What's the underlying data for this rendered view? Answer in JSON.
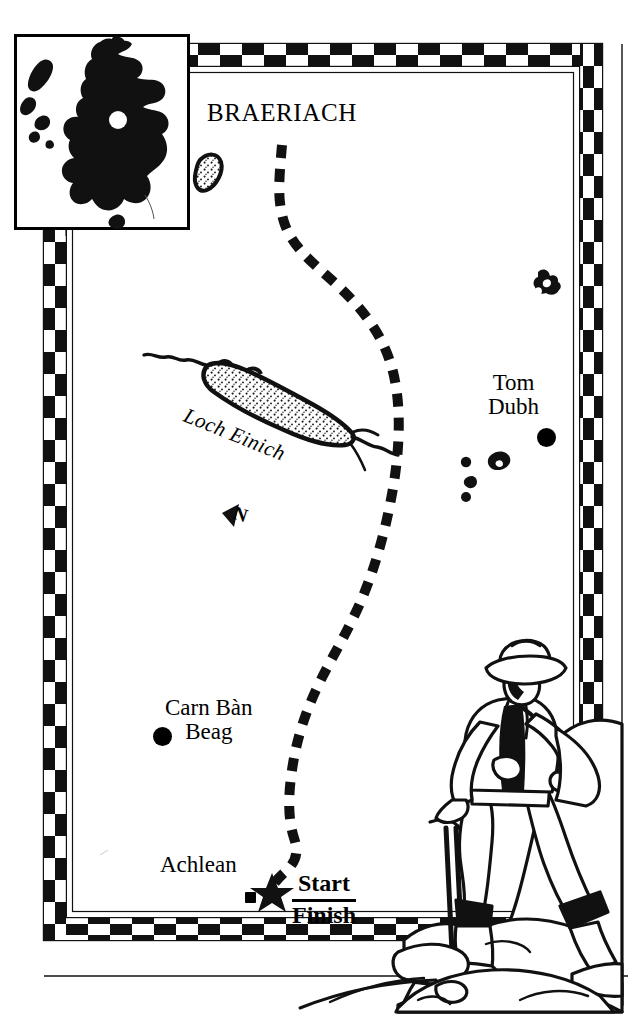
{
  "figure": {
    "type": "hiking-route-map",
    "region": "Cairngorms, Scotland"
  },
  "map": {
    "title": "BRAERIACH",
    "labels": {
      "braeriach": "BRAERIACH",
      "tom_dubh_line1": "Tom",
      "tom_dubh_line2": "Dubh",
      "carn_ban_line1": "Carn Bàn",
      "carn_ban_line2": "Beag",
      "achlean": "Achlean",
      "loch_einich": "Loch Einich",
      "north_arrow": "N"
    },
    "start_finish": {
      "start": "Start",
      "finish": "Finish"
    },
    "markers": [
      {
        "name": "tom-dubh-summit",
        "shape": "filled-circle"
      },
      {
        "name": "carn-ban-beag-summit",
        "shape": "filled-circle"
      },
      {
        "name": "achlean-settlement",
        "shape": "filled-square"
      },
      {
        "name": "start-finish-point",
        "shape": "filled-star"
      }
    ],
    "route": {
      "style": "dashed",
      "description": "walking route from Achlean north to Braeriach"
    },
    "colors": {
      "ink": "#000000",
      "paper": "#ffffff"
    }
  },
  "inset": {
    "name": "scotland-locator-map",
    "marker": "white-circle"
  },
  "illustration": {
    "name": "hiker-on-rocks",
    "description": "line drawing of a walker with hat and walking stick standing on rocks"
  },
  "border": {
    "name": "checkered-border",
    "pattern": "two-row black and white checkerboard"
  }
}
